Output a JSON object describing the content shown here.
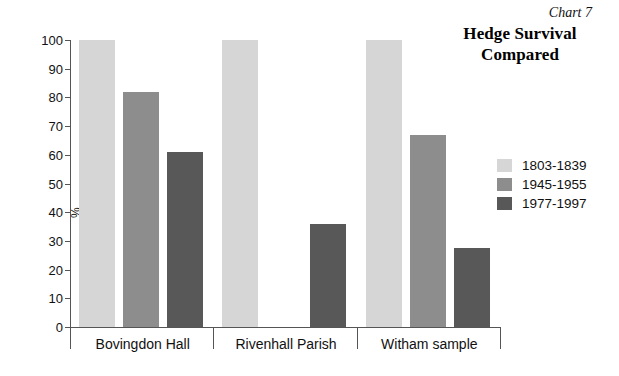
{
  "header": {
    "chart_number": "Chart 7",
    "title_line1": "Hedge Survival",
    "title_line2": "Compared"
  },
  "axis": {
    "y_title": "%",
    "y_ticks": [
      "100",
      "90",
      "80",
      "70",
      "60",
      "50",
      "40",
      "30",
      "20",
      "10",
      "0"
    ]
  },
  "legend": {
    "items": [
      {
        "label": "1803-1839",
        "color": "#d6d6d6"
      },
      {
        "label": "1945-1955",
        "color": "#8d8d8d"
      },
      {
        "label": "1977-1997",
        "color": "#585858"
      }
    ]
  },
  "categories": [
    {
      "label": "Bovingdon Hall"
    },
    {
      "label": "Rivenhall Parish"
    },
    {
      "label": "Witham sample"
    }
  ],
  "chart_data": {
    "type": "bar",
    "title": "Hedge Survival Compared",
    "subtitle": "Chart 7",
    "xlabel": "",
    "ylabel": "%",
    "ylim": [
      0,
      100
    ],
    "ytick_step": 10,
    "grid": false,
    "legend_position": "right",
    "categories": [
      "Bovingdon Hall",
      "Rivenhall Parish",
      "Witham sample"
    ],
    "series": [
      {
        "name": "1803-1839",
        "color": "#d6d6d6",
        "values": [
          100,
          100,
          100
        ]
      },
      {
        "name": "1945-1955",
        "color": "#8d8d8d",
        "values": [
          82,
          0,
          67
        ]
      },
      {
        "name": "1977-1997",
        "color": "#585858",
        "values": [
          61,
          36,
          27.5
        ]
      }
    ]
  }
}
